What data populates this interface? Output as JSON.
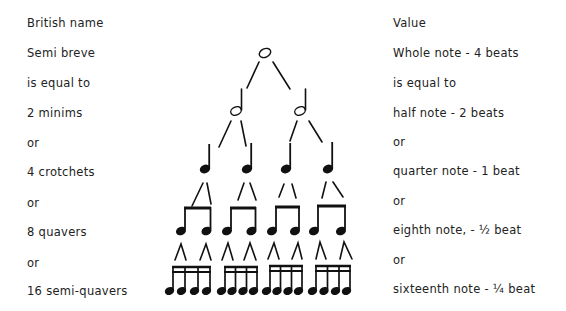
{
  "left_column": {
    "header": "British name",
    "rows": [
      "Semi breve",
      "is equal to",
      "2 minims",
      "or",
      "4 crotchets",
      "or",
      "8 quavers",
      "or",
      "16 semi-quavers"
    ]
  },
  "right_column": {
    "header": "Value",
    "rows": [
      "Whole note - 4 beats",
      "is equal to",
      "half note - 2 beats",
      "or",
      "quarter note - 1 beat",
      "or",
      "eighth note, - ½ beat",
      "or",
      "sixteenth note - ¼ beat"
    ]
  },
  "tree": {
    "levels": [
      {
        "name": "whole-note",
        "count": 1
      },
      {
        "name": "half-note",
        "count": 2
      },
      {
        "name": "quarter-note",
        "count": 4
      },
      {
        "name": "eighth-note",
        "count": 8
      },
      {
        "name": "sixteenth-note",
        "count": 16
      }
    ],
    "ink_color": "#111111"
  }
}
